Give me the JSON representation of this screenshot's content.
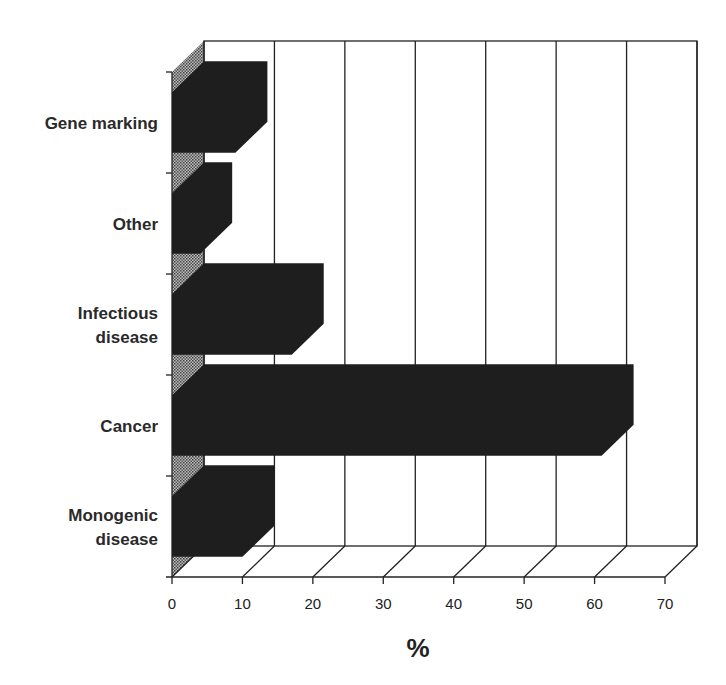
{
  "chart_data": {
    "type": "bar",
    "orientation": "horizontal",
    "style": "3d",
    "title": "",
    "xlabel": "%",
    "ylabel": "",
    "categories": [
      "Gene marking",
      "Other",
      "Infectious disease",
      "Cancer",
      "Monogenic disease"
    ],
    "values": [
      9,
      4,
      17,
      61,
      10
    ],
    "xlim": [
      0,
      70
    ],
    "xticks": [
      "0",
      "10",
      "20",
      "30",
      "40",
      "50",
      "60",
      "70"
    ],
    "grid": true,
    "legend": null
  },
  "labels": {
    "cat0": [
      "Gene marking"
    ],
    "cat1": [
      "Other"
    ],
    "cat2": [
      "Infectious",
      "disease"
    ],
    "cat3": [
      "Cancer"
    ],
    "cat4": [
      "Monogenic",
      "disease"
    ],
    "xlabel": "%"
  },
  "colors": {
    "bar": "#1e1e1e",
    "wall_hatch": "#777777",
    "grid": "#222222"
  }
}
